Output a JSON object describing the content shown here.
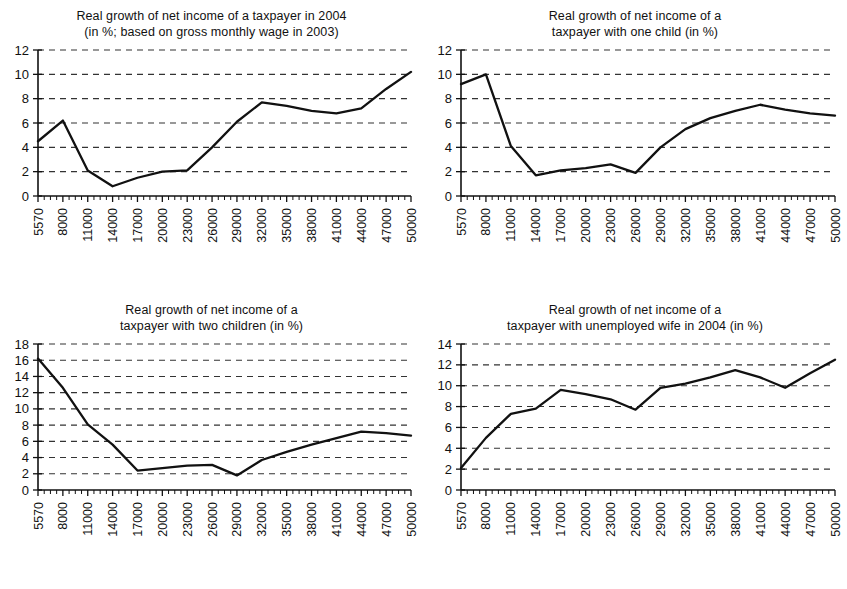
{
  "figure": {
    "name": "real-growth-net-income-panels",
    "panel_count": 4,
    "line_color": "#111111",
    "grid_color": "#333333",
    "background": "#ffffff"
  },
  "chart_data": [
    {
      "id": "panel-top-left",
      "type": "line",
      "title": "Real growth of net income of a taxpayer in 2004",
      "subtitle": "(in %; based on gross monthly wage in 2003)",
      "title_lines": [
        "Real growth of net income of a taxpayer in 2004",
        "(in %; based on gross monthly wage in 2003)"
      ],
      "xlabel": "",
      "ylabel": "",
      "grid": true,
      "legend": "none",
      "ylim": [
        0,
        12
      ],
      "yticks": [
        0,
        2,
        4,
        6,
        8,
        10,
        12
      ],
      "ytick_labels": [
        "0",
        "2",
        "4",
        "6",
        "8",
        "10",
        "12"
      ],
      "minor_x_ticks_between": 3,
      "categories": [
        "5570",
        "8000",
        "11000",
        "14000",
        "17000",
        "20000",
        "23000",
        "26000",
        "29000",
        "32000",
        "35000",
        "38000",
        "41000",
        "44000",
        "47000",
        "50000"
      ],
      "values": [
        4.5,
        6.2,
        2.1,
        0.8,
        1.5,
        2.0,
        2.1,
        4.0,
        6.1,
        7.7,
        7.4,
        7.0,
        6.8,
        7.2,
        8.8,
        10.2
      ]
    },
    {
      "id": "panel-top-right",
      "type": "line",
      "title": "Real growth of net income of a taxpayer with one child (in %)",
      "subtitle": "",
      "title_lines": [
        "Real growth of net income of a",
        "taxpayer with one child (in %)"
      ],
      "xlabel": "",
      "ylabel": "",
      "grid": true,
      "legend": "none",
      "ylim": [
        0,
        12
      ],
      "yticks": [
        0,
        2,
        4,
        6,
        8,
        10,
        12
      ],
      "ytick_labels": [
        "0",
        "2",
        "4",
        "6",
        "8",
        "10",
        "12"
      ],
      "minor_x_ticks_between": 3,
      "categories": [
        "5570",
        "8000",
        "11000",
        "14000",
        "17000",
        "20000",
        "23000",
        "26000",
        "29000",
        "32000",
        "35000",
        "38000",
        "41000",
        "44000",
        "47000",
        "50000"
      ],
      "values": [
        9.2,
        10.0,
        4.1,
        1.7,
        2.1,
        2.3,
        2.6,
        1.9,
        4.0,
        5.5,
        6.4,
        7.0,
        7.5,
        7.1,
        6.8,
        6.6
      ]
    },
    {
      "id": "panel-bottom-left",
      "type": "line",
      "title": "Real growth of net income of a taxpayer with two children (in %)",
      "subtitle": "",
      "title_lines": [
        "Real growth of net income of a",
        "taxpayer with two children (in %)"
      ],
      "xlabel": "",
      "ylabel": "",
      "grid": true,
      "legend": "none",
      "ylim": [
        0,
        18
      ],
      "yticks": [
        0,
        2,
        4,
        6,
        8,
        10,
        12,
        14,
        16,
        18
      ],
      "ytick_labels": [
        "0",
        "2",
        "4",
        "6",
        "8",
        "10",
        "12",
        "14",
        "16",
        "18"
      ],
      "minor_x_ticks_between": 3,
      "categories": [
        "5570",
        "8000",
        "11000",
        "14000",
        "17000",
        "20000",
        "23000",
        "26000",
        "29000",
        "32000",
        "35000",
        "38000",
        "41000",
        "44000",
        "47000",
        "50000"
      ],
      "values": [
        16.2,
        12.6,
        8.1,
        5.6,
        2.4,
        2.7,
        3.0,
        3.1,
        1.8,
        3.7,
        4.7,
        5.6,
        6.4,
        7.2,
        7.0,
        6.7
      ]
    },
    {
      "id": "panel-bottom-right",
      "type": "line",
      "title": "Real growth of net income of a taxpayer with unemployed wife in 2004 (in %)",
      "subtitle": "",
      "title_lines": [
        "Real growth of net income of a",
        "taxpayer with unemployed wife in 2004 (in %)"
      ],
      "xlabel": "",
      "ylabel": "",
      "grid": true,
      "legend": "none",
      "ylim": [
        0,
        14
      ],
      "yticks": [
        0,
        2,
        4,
        6,
        8,
        10,
        12,
        14
      ],
      "ytick_labels": [
        "0",
        "2",
        "4",
        "6",
        "8",
        "10",
        "12",
        "14"
      ],
      "minor_x_ticks_between": 3,
      "categories": [
        "5570",
        "8000",
        "11000",
        "14000",
        "17000",
        "20000",
        "23000",
        "26000",
        "29000",
        "32000",
        "35000",
        "38000",
        "41000",
        "44000",
        "47000",
        "50000"
      ],
      "values": [
        2.1,
        5.0,
        7.3,
        7.8,
        9.6,
        9.2,
        8.7,
        7.7,
        9.8,
        10.2,
        10.8,
        11.5,
        10.8,
        9.8,
        11.2,
        12.5
      ]
    }
  ]
}
